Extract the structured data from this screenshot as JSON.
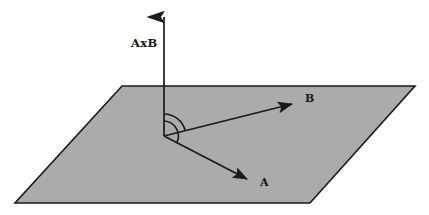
{
  "figure": {
    "background_color": "#ffffff",
    "stroke_color": "#1a1a1a"
  },
  "plane": {
    "name": "shaded-plane",
    "fill_color": "#ababab",
    "stroke_color": "#1a1a1a",
    "points": "122,86 415,86 310,203 15,203"
  },
  "labels": {
    "normal": "AxB",
    "vector_a": "A",
    "vector_b": "B"
  },
  "vectors": [
    {
      "id": "cross-product",
      "label": "AxB",
      "origin": [
        164,
        136
      ],
      "tip": [
        164,
        6
      ],
      "label_pos": [
        131,
        47
      ]
    },
    {
      "id": "vector-b",
      "label": "B",
      "origin": [
        164,
        136
      ],
      "tip": [
        299,
        103
      ],
      "label_pos": [
        305,
        102
      ]
    },
    {
      "id": "vector-a",
      "label": "A",
      "origin": [
        164,
        136
      ],
      "tip": [
        254,
        183
      ],
      "label_pos": [
        260,
        185
      ]
    }
  ],
  "angle_arc": {
    "name": "angle-between-vectors",
    "center": [
      164,
      136
    ],
    "radius": 22,
    "stroke_color": "#1a1a1a"
  },
  "colors": {
    "plane_fill": "#ababab",
    "line": "#1a1a1a",
    "background": "#ffffff"
  }
}
